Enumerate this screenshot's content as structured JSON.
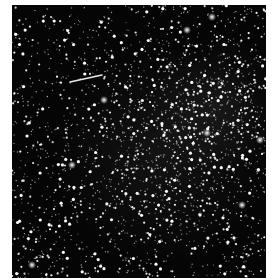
{
  "image": {
    "subject": "Dense star field with a bright streak",
    "background_color": "#050505",
    "frame_color": "#ffffff",
    "photo_box": {
      "x": 12,
      "y": 5,
      "width": 254,
      "height": 273
    },
    "star_color": "#ffffff",
    "streak": {
      "x1": 58,
      "y1": 77,
      "x2": 90,
      "y2": 70,
      "color": "#e8e8e8"
    },
    "dense_regions": [
      {
        "cx": 205,
        "cy": 100,
        "r": 70,
        "weight": 2.2
      },
      {
        "cx": 150,
        "cy": 150,
        "r": 110,
        "weight": 1.4
      }
    ],
    "bright_stars": [
      {
        "x": 92,
        "y": 95
      },
      {
        "x": 200,
        "y": 12
      },
      {
        "x": 175,
        "y": 25
      },
      {
        "x": 248,
        "y": 135
      },
      {
        "x": 195,
        "y": 128
      },
      {
        "x": 230,
        "y": 200
      },
      {
        "x": 60,
        "y": 160
      },
      {
        "x": 20,
        "y": 260
      }
    ],
    "star_count": 2200,
    "seed": 42
  }
}
